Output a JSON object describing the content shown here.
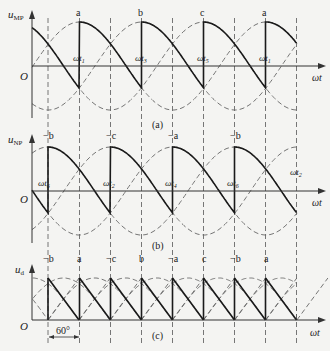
{
  "figure": {
    "panels": [
      {
        "id": "a",
        "caption": "(a)",
        "ylabel": "u",
        "ylabel_sub": "MP",
        "xlabel": "ωt",
        "origin": "O",
        "peak_labels": [
          "a",
          "b",
          "c",
          "a"
        ],
        "time_labels": [
          {
            "base": "ωt",
            "sub": "1"
          },
          {
            "base": "ωt",
            "sub": "3"
          },
          {
            "base": "ωt",
            "sub": "5"
          },
          {
            "base": "ωt",
            "sub": "1"
          }
        ]
      },
      {
        "id": "b",
        "caption": "(b)",
        "ylabel": "u",
        "ylabel_sub": "NP",
        "xlabel": "ωt",
        "origin": "O",
        "peak_labels": [
          "−b",
          "−c",
          "−a",
          "−b"
        ],
        "time_labels": [
          {
            "base": "ωt",
            "sub": "6"
          },
          {
            "base": "ωt",
            "sub": "2"
          },
          {
            "base": "ωt",
            "sub": "4"
          },
          {
            "base": "ωt",
            "sub": "6"
          },
          {
            "base": "ωt",
            "sub": "2"
          }
        ]
      },
      {
        "id": "c",
        "caption": "(c)",
        "ylabel": "u",
        "ylabel_sub": "d",
        "xlabel": "ωt",
        "origin": "O",
        "top_labels": [
          "−b",
          "a",
          "−c",
          "b",
          "−a",
          "c",
          "−b",
          "a"
        ],
        "interval_label": "60°"
      }
    ]
  },
  "colors": {
    "background": "#f4f4f2",
    "solid": "#1a1a1a",
    "dashed": "#666666"
  }
}
